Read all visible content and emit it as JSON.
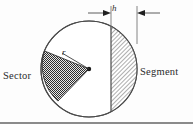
{
  "figure": {
    "background_color": "#fdfdfd",
    "line_color": "#555555",
    "labels": {
      "sector": "Sector",
      "segment": "Segment",
      "radius": "r",
      "height": "h"
    },
    "geometry": {
      "circle_center_x": 89,
      "circle_center_y": 69,
      "circle_radius": 48,
      "chord_x": 111,
      "sector_start_angle_deg": 158,
      "sector_end_angle_deg": 228,
      "segment_fill": "diagonal-hatch",
      "sector_fill": "dark-checker",
      "dimension_line_y": 13,
      "dimension_left_x": 111,
      "dimension_right_x": 137
    },
    "rule": {
      "y": 122,
      "color": "#888888",
      "thickness": 2
    }
  }
}
